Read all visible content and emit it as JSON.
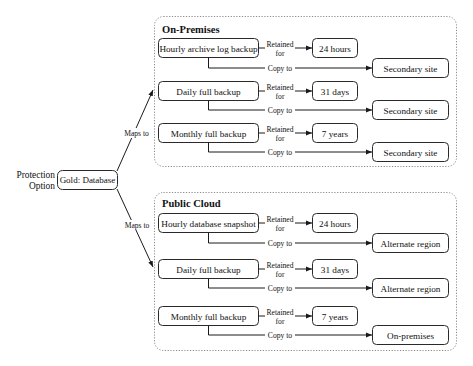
{
  "protection": {
    "label_line1": "Protection",
    "label_line2": "Option",
    "option": "Gold: Database"
  },
  "mappings": [
    {
      "label": "Maps to",
      "target": "On-Premises"
    },
    {
      "label": "Maps to",
      "target": "Public Cloud"
    }
  ],
  "sites": [
    {
      "title": "On-Premises",
      "rows": [
        {
          "backup": "Hourly archive log backup",
          "retained_1": "Retained",
          "retained_2": "for",
          "retention": "24 hours",
          "copy_label": "Copy to",
          "copy_target": "Secondary site"
        },
        {
          "backup": "Daily full backup",
          "retained_1": "Retained",
          "retained_2": "for",
          "retention": "31 days",
          "copy_label": "Copy to",
          "copy_target": "Secondary site"
        },
        {
          "backup": "Monthly full backup",
          "retained_1": "Retained",
          "retained_2": "for",
          "retention": "7 years",
          "copy_label": "Copy to",
          "copy_target": "Secondary site"
        }
      ]
    },
    {
      "title": "Public Cloud",
      "rows": [
        {
          "backup": "Hourly database snapshot",
          "retained_1": "Retained",
          "retained_2": "for",
          "retention": "24 hours",
          "copy_label": "Copy to",
          "copy_target": "Alternate region"
        },
        {
          "backup": "Daily full backup",
          "retained_1": "Retained",
          "retained_2": "for",
          "retention": "31 days",
          "copy_label": "Copy to",
          "copy_target": "Alternate region"
        },
        {
          "backup": "Monthly full backup",
          "retained_1": "Retained",
          "retained_2": "for",
          "retention": "7 years",
          "copy_label": "Copy to",
          "copy_target": "On-premises"
        }
      ]
    }
  ],
  "colors": {
    "line": "#1a1a1a",
    "box_border": "#2a2a2a",
    "site_border": "#8a8a8a",
    "background": "#ffffff"
  }
}
